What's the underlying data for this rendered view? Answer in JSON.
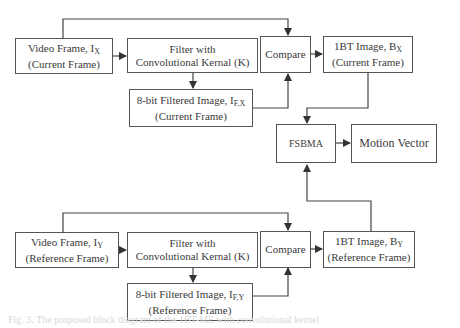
{
  "diagram": {
    "current": {
      "video_frame": {
        "line1": "Video Frame, I",
        "sub": "X",
        "line2": "(Current Frame)"
      },
      "filter": {
        "line1": "Filter with",
        "line2": "Convolutional Kernal (K)"
      },
      "filtered": {
        "line1": "8-bit Filtered Image, I",
        "sub": "F,X",
        "line2": "(Current Frame)"
      },
      "compare": {
        "label": "Compare"
      },
      "onebt": {
        "line1": "1BT Image, B",
        "sub": "X",
        "line2": "(Current Frame)"
      }
    },
    "reference": {
      "video_frame": {
        "line1": "Video Frame, I",
        "sub": "Y",
        "line2": "(Reference Frame)"
      },
      "filter": {
        "line1": "Filter with",
        "line2": "Convolutional Kernal (K)"
      },
      "filtered": {
        "line1": "8-bit Filtered Image, I",
        "sub": "F,Y",
        "line2": "(Reference Frame)"
      },
      "compare": {
        "label": "Compare"
      },
      "onebt": {
        "line1": "1BT Image, B",
        "sub": "Y",
        "line2": "(Reference Frame)"
      }
    },
    "fsbma": {
      "label": "FSBMA"
    },
    "motion_vector": {
      "label": "Motion Vector"
    }
  },
  "caption": "Fig. 3. The proposed block diagram of the 1BT-ME with convolutional kernel"
}
